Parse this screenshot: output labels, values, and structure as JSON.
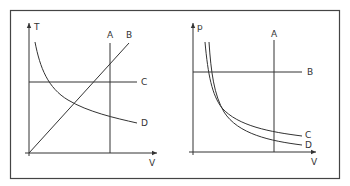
{
  "figure": {
    "stroke_color": "#333333",
    "frame_color": "#444444",
    "background": "#ffffff"
  },
  "left_graph": {
    "y_axis_label": "T",
    "x_axis_label": "V",
    "curves": [
      {
        "id": "A",
        "label": "A",
        "kind": "vertical line (isochoric)"
      },
      {
        "id": "B",
        "label": "B",
        "kind": "straight line through origin (isobaric)"
      },
      {
        "id": "C",
        "label": "C",
        "kind": "horizontal line (isothermal)"
      },
      {
        "id": "D",
        "label": "D",
        "kind": "decreasing curve (adiabatic)"
      }
    ]
  },
  "right_graph": {
    "y_axis_label": "p",
    "x_axis_label": "V",
    "curves": [
      {
        "id": "A",
        "label": "A",
        "kind": "vertical line (isochoric)"
      },
      {
        "id": "B",
        "label": "B",
        "kind": "horizontal line (isobaric)"
      },
      {
        "id": "C",
        "label": "C",
        "kind": "hyperbola (isothermal)"
      },
      {
        "id": "D",
        "label": "D",
        "kind": "steeper hyperbola (adiabatic)"
      }
    ]
  }
}
